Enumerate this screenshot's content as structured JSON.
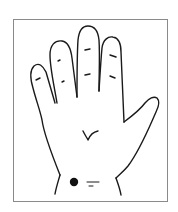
{
  "figure": {
    "marker": "acupressure point on wrist",
    "colors": {
      "ink": "#1a1a1a",
      "frame": "#8a8a8a",
      "background": "#ffffff"
    }
  }
}
